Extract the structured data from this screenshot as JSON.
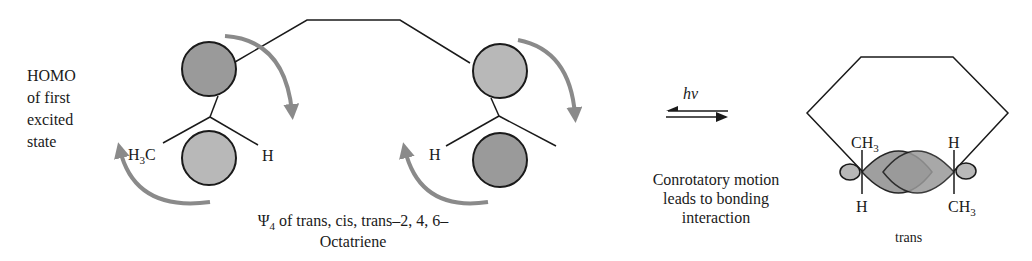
{
  "left_label": {
    "lines": [
      "HOMO",
      "of first",
      "excited",
      "state"
    ]
  },
  "molecule_left": {
    "substituent_left": "H",
    "substituent_left_sub": "3",
    "substituent_left_tail": "C",
    "substituent_right": "H",
    "top_lobe_shade": "#9a9a9a",
    "bottom_lobe_shade": "#b8b8b8"
  },
  "molecule_right": {
    "substituent_left": "H",
    "top_lobe_shade": "#b8b8b8",
    "bottom_lobe_shade": "#9a9a9a"
  },
  "caption": {
    "psi": "Ψ",
    "psi_sub": "4",
    "line1_rest": " of trans, cis, trans–2, 4, 6–",
    "line2": "Octatriene"
  },
  "reaction": {
    "condition": "hv",
    "arrow_type": "equilibrium"
  },
  "explanation": {
    "lines": [
      "Conrotatory motion",
      "leads to bonding",
      "interaction"
    ]
  },
  "product": {
    "top_left_label": "CH",
    "top_left_sub": "3",
    "top_right_label": "H",
    "bottom_left_label": "H",
    "bottom_right_label": "CH",
    "bottom_right_sub": "3",
    "stereo_label": "trans"
  },
  "colors": {
    "arrow": "#8a8a8a",
    "lobe_dark": "#9a9a9a",
    "lobe_light": "#b8b8b8",
    "line": "#1a1a1a"
  }
}
